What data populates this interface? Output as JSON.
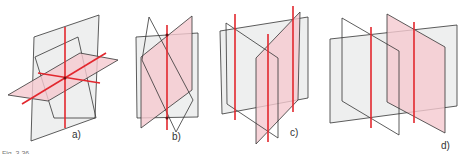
{
  "figure": {
    "caption": "Fig. 3.36",
    "panels": [
      {
        "id": "a",
        "label": "a)",
        "description": "three planes intersecting pairwise in three lines through a common point"
      },
      {
        "id": "b",
        "label": "b)",
        "description": "three planes sharing one common line"
      },
      {
        "id": "c",
        "label": "c)",
        "description": "three planes intersecting pairwise in three parallel lines"
      },
      {
        "id": "d",
        "label": "d)",
        "description": "two parallel planes cut by a third plane in two parallel lines"
      }
    ]
  },
  "colors": {
    "plane_gray": "#e8eaea",
    "plane_pink": "#f5c9cf",
    "intersection_line": "#e2272e",
    "outline": "#333333"
  }
}
